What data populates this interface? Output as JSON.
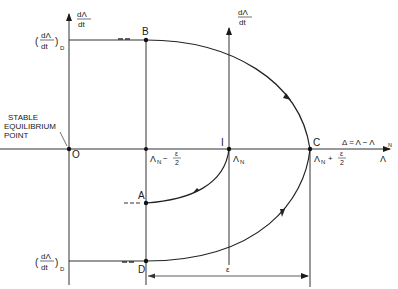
{
  "diagram": {
    "axes": {
      "left_y_label_num": "dΛ",
      "left_y_label_den": "dt",
      "right_y_label_num": "dΛ",
      "right_y_label_den": "dt",
      "x_label": "Λ",
      "delta_definition": "Δ = Λ − Λ",
      "delta_sub": "N"
    },
    "ticks": {
      "top_num": "dΛ",
      "top_den": "dt",
      "top_sub": "D",
      "bottom_num": "dΛ",
      "bottom_den": "dt",
      "bottom_sub": "D"
    },
    "points": {
      "O": "O",
      "B": "B",
      "A": "A",
      "I": "I",
      "C": "C",
      "D": "D"
    },
    "x_marks": {
      "left": "Λ",
      "left_sub": "N",
      "left_op": "−",
      "left_frac_num": "ε",
      "left_frac_den": "2",
      "center": "Λ",
      "center_sub": "N",
      "right": "Λ",
      "right_sub": "N",
      "right_op": "+",
      "right_frac_num": "ε",
      "right_frac_den": "2"
    },
    "annotation": {
      "line1": "STABLE",
      "line2": "EQUILIBRIUM",
      "line3": "POINT"
    },
    "dimension": {
      "label": "ε"
    }
  }
}
